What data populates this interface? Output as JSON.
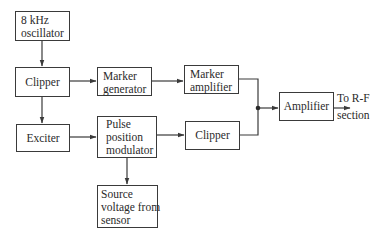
{
  "diagram": {
    "type": "block-diagram",
    "blocks": {
      "oscillator": {
        "lines": [
          "8 kHz",
          "oscillator"
        ]
      },
      "clipper_top": {
        "label": "Clipper"
      },
      "marker_generator": {
        "lines": [
          "Marker",
          "generator"
        ]
      },
      "marker_amplifier": {
        "lines": [
          "Marker",
          "amplifier"
        ]
      },
      "exciter": {
        "label": "Exciter"
      },
      "ppm": {
        "lines": [
          "Pulse",
          "position",
          "modulator"
        ]
      },
      "clipper_bottom": {
        "label": "Clipper"
      },
      "source": {
        "lines": [
          "Source",
          "voltage from",
          "sensor"
        ]
      },
      "amplifier": {
        "label": "Amplifier"
      }
    },
    "output": {
      "lines": [
        "To R-F",
        "section"
      ]
    },
    "connections": [
      [
        "8 kHz oscillator",
        "Clipper"
      ],
      [
        "Clipper",
        "Marker generator"
      ],
      [
        "Clipper",
        "Exciter"
      ],
      [
        "Marker generator",
        "Marker amplifier"
      ],
      [
        "Exciter",
        "Pulse position modulator"
      ],
      [
        "Pulse position modulator",
        "Clipper"
      ],
      [
        "Pulse position modulator",
        "Source voltage from sensor"
      ],
      [
        "Marker amplifier",
        "Amplifier"
      ],
      [
        "Clipper",
        "Amplifier"
      ],
      [
        "Amplifier",
        "To R-F section"
      ]
    ],
    "colors": {
      "line": "#3a3a3a",
      "text": "#2a2a2a",
      "background": "#ffffff"
    }
  }
}
